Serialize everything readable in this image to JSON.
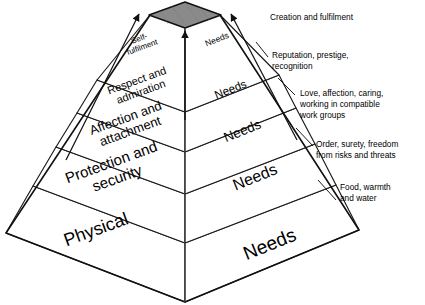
{
  "diagram": {
    "apex_color": "#8a8a8a",
    "line_color": "#1a1a1a",
    "face_color": "#ffffff"
  },
  "tiers": [
    {
      "id": "self-fulfilment",
      "level": 5,
      "left_label_lines": [
        "Self-",
        "fulfilment"
      ],
      "right_label": "Needs",
      "annotation_lines": [
        "Creation and fulfilment"
      ]
    },
    {
      "id": "respect",
      "level": 4,
      "left_label_lines": [
        "Respect and",
        "admiration"
      ],
      "right_label": "Needs",
      "annotation_lines": [
        "Reputation, prestige,",
        "recognition"
      ]
    },
    {
      "id": "affection",
      "level": 3,
      "left_label_lines": [
        "Affection and",
        "attachment"
      ],
      "right_label": "Needs",
      "annotation_lines": [
        "Love, affection, caring,",
        "working in compatible",
        "work groups"
      ]
    },
    {
      "id": "protection",
      "level": 2,
      "left_label_lines": [
        "Protection and",
        "security"
      ],
      "right_label": "Needs",
      "annotation_lines": [
        "Order, surety, freedom",
        "from risks and threats"
      ]
    },
    {
      "id": "physical",
      "level": 1,
      "left_label_lines": [
        "Physical"
      ],
      "right_label": "Needs",
      "annotation_lines": [
        "Food, warmth",
        "and water"
      ]
    }
  ]
}
